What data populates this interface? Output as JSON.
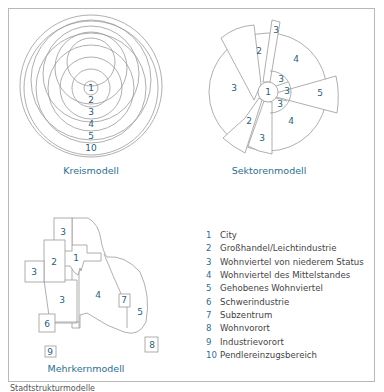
{
  "colors": {
    "accent": "#2b6f8e",
    "line": "#9a9a9a",
    "label_text": "#444444"
  },
  "kreismodell": {
    "title": "Kreismodell",
    "rings": [
      "1",
      "2",
      "3",
      "4",
      "5",
      "10"
    ]
  },
  "sektorenmodell": {
    "title": "Sektorenmodell",
    "labels": {
      "center": "1",
      "upper_left_2": "2",
      "top_3": "3",
      "upper_right_4": "4",
      "left_3": "3",
      "inner_upper_3": "3",
      "inner_right_3": "3",
      "inner_lower_3": "3",
      "right_5": "5",
      "lower_left_2": "2",
      "lower_3": "3",
      "lower_right_4": "4"
    }
  },
  "mehrkernmodell": {
    "title": "Mehrkernmodell",
    "labels": {
      "top_3": "3",
      "zone_2": "2",
      "zone_1": "1",
      "left_3": "3",
      "middle_3": "3",
      "zone_4": "4",
      "zone_7": "7",
      "zone_5": "5",
      "zone_6": "6",
      "zone_8": "8",
      "zone_9": "9"
    }
  },
  "legend": [
    {
      "num": "1",
      "label": "City"
    },
    {
      "num": "2",
      "label": "Großhandel/Leichtindustrie"
    },
    {
      "num": "3",
      "label": "Wohnviertel von niederem Status"
    },
    {
      "num": "4",
      "label": "Wohnviertel des Mittelstandes"
    },
    {
      "num": "5",
      "label": "Gehobenes Wohnviertel"
    },
    {
      "num": "6",
      "label": "Schwerindustrie"
    },
    {
      "num": "7",
      "label": "Subzentrum"
    },
    {
      "num": "8",
      "label": "Wohnvorort"
    },
    {
      "num": "9",
      "label": "Industrievorort"
    },
    {
      "num": "10",
      "label": "Pendlereinzugsbereich"
    }
  ],
  "caption": "Stadtstrukturmodelle"
}
